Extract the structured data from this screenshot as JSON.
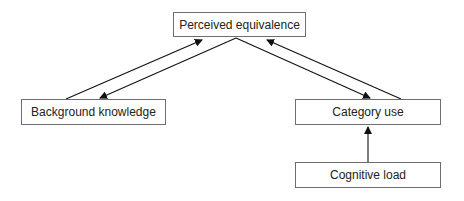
{
  "diagram": {
    "nodes": [
      {
        "id": "perceived",
        "label": "Perceived equivalence"
      },
      {
        "id": "background",
        "label": "Background knowledge"
      },
      {
        "id": "category",
        "label": "Category use"
      },
      {
        "id": "cognitive",
        "label": "Cognitive load"
      }
    ],
    "edges": [
      {
        "from": "background",
        "to": "perceived"
      },
      {
        "from": "perceived",
        "to": "background"
      },
      {
        "from": "perceived",
        "to": "category"
      },
      {
        "from": "category",
        "to": "perceived"
      },
      {
        "from": "cognitive",
        "to": "category"
      }
    ],
    "colors": {
      "box_border": "#6e6e6e",
      "arrow": "#111111",
      "text": "#222222"
    }
  }
}
